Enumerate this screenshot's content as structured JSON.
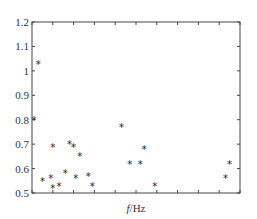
{
  "chart_data": {
    "type": "scatter",
    "title": "",
    "xlabel": "f/Hz",
    "ylabel": "",
    "ylim": [
      0.5,
      1.2
    ],
    "yticks": [
      0.5,
      0.6,
      0.7,
      0.8,
      0.9,
      1.0,
      1.1,
      1.2
    ],
    "ytick_labels": [
      "0.5",
      "0.6",
      "0.7",
      "0.8",
      "0.9",
      "1",
      "1.1",
      "1.2"
    ],
    "xticks_count": 11,
    "xtick_labels": [],
    "grid": false,
    "legend": null,
    "marker": "*",
    "series": [
      {
        "name": "",
        "points": [
          {
            "x": 0.1,
            "y": 0.8
          },
          {
            "x": 0.3,
            "y": 1.03
          },
          {
            "x": 0.5,
            "y": 0.55
          },
          {
            "x": 0.9,
            "y": 0.56
          },
          {
            "x": 1.0,
            "y": 0.69
          },
          {
            "x": 1.0,
            "y": 0.52
          },
          {
            "x": 1.3,
            "y": 0.53
          },
          {
            "x": 1.6,
            "y": 0.58
          },
          {
            "x": 1.8,
            "y": 0.7
          },
          {
            "x": 2.0,
            "y": 0.69
          },
          {
            "x": 2.1,
            "y": 0.56
          },
          {
            "x": 2.3,
            "y": 0.65
          },
          {
            "x": 2.7,
            "y": 0.57
          },
          {
            "x": 2.9,
            "y": 0.53
          },
          {
            "x": 4.3,
            "y": 0.77
          },
          {
            "x": 4.7,
            "y": 0.62
          },
          {
            "x": 5.2,
            "y": 0.62
          },
          {
            "x": 5.4,
            "y": 0.68
          },
          {
            "x": 5.9,
            "y": 0.53
          },
          {
            "x": 9.3,
            "y": 0.56
          },
          {
            "x": 9.5,
            "y": 0.62
          }
        ]
      }
    ],
    "xlim": [
      0,
      10
    ]
  }
}
